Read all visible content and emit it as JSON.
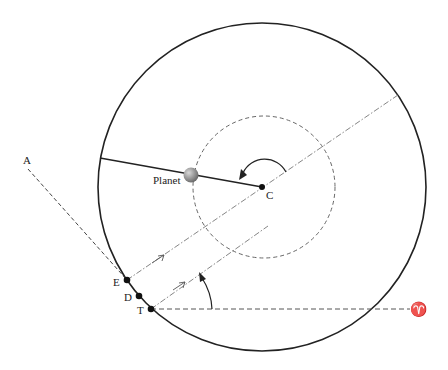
{
  "labels": {
    "planet": "Planet",
    "center": "C",
    "point_a": "A",
    "point_e": "E",
    "point_d": "D",
    "point_t": "T",
    "aries": "♈"
  },
  "colors": {
    "stroke": "#222222",
    "dashed": "#555555",
    "dashdot": "#777777",
    "planet_light": "#cfcfcf",
    "planet_dark": "#6a6a6a"
  },
  "geometry": {
    "deferent_center": [
      262,
      187
    ],
    "deferent_radius": 164,
    "epicycle_center": [
      264,
      187
    ],
    "epicycle_radius": 71,
    "planet": [
      190,
      175
    ],
    "points": {
      "A": [
        24,
        163
      ],
      "E": [
        127,
        280
      ],
      "D": [
        139,
        296
      ],
      "T": [
        151,
        309
      ],
      "C": [
        262,
        187
      ]
    }
  }
}
